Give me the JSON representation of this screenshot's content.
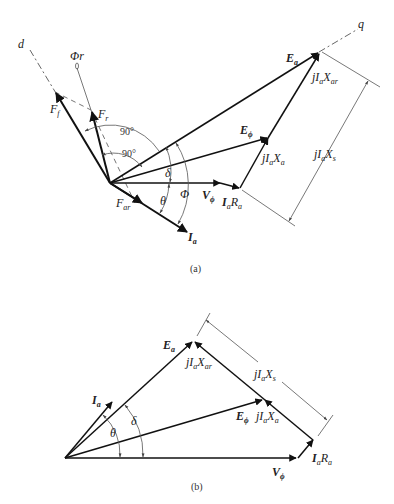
{
  "figure": {
    "panels": [
      {
        "caption": "(a)",
        "axes": {
          "d": "d",
          "q": "q",
          "flux": "Φr"
        },
        "vectors": {
          "Ea": "E",
          "Ea_sub": "a",
          "Ephi": "E",
          "Ephi_sub": "ϕ",
          "Vphi": "V",
          "Vphi_sub": "ϕ",
          "Ia": "I",
          "Ia_sub": "a",
          "IaRa_I": "I",
          "IaRa_I_sub": "a",
          "IaRa_R": "R",
          "IaRa_R_sub": "a",
          "jIaXa": "jI",
          "jIaXa_sub1": "a",
          "jIaXa_X": "X",
          "jIaXa_sub2": "a",
          "jIaXar": "jI",
          "jIaXar_sub1": "a",
          "jIaXar_X": "X",
          "jIaXar_sub2": "ar",
          "jIaXs": "jI",
          "jIaXs_sub1": "a",
          "jIaXs_X": "X",
          "jIaXs_sub2": "s",
          "Ff": "F",
          "Ff_sub": "f",
          "Fr": "F",
          "Fr_sub": "r",
          "Far": "F",
          "Far_sub": "ar"
        },
        "angles": {
          "right1": "90°",
          "right2": "90°",
          "delta": "δ",
          "theta": "θ",
          "Phi": "Φ"
        }
      },
      {
        "caption": "(b)",
        "vectors": {
          "Ea": "E",
          "Ea_sub": "a",
          "Ephi": "E",
          "Ephi_sub": "ϕ",
          "Vphi": "V",
          "Vphi_sub": "ϕ",
          "Ia": "I",
          "Ia_sub": "a",
          "IaRa_I": "I",
          "IaRa_I_sub": "a",
          "IaRa_R": "R",
          "IaRa_R_sub": "a",
          "jIaXa": "jI",
          "jIaXa_sub1": "a",
          "jIaXa_X": "X",
          "jIaXa_sub2": "a",
          "jIaXar": "jI",
          "jIaXar_sub1": "a",
          "jIaXar_X": "X",
          "jIaXar_sub2": "ar",
          "jIaXs": "jI",
          "jIaXs_sub1": "a",
          "jIaXs_X": "X",
          "jIaXs_sub2": "s"
        },
        "angles": {
          "delta": "δ",
          "theta": "θ"
        }
      }
    ]
  }
}
